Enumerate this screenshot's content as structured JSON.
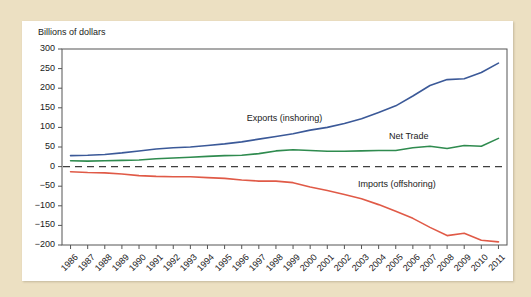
{
  "figure": {
    "background_color": "#ece0c2",
    "panel_color": "#ffffff"
  },
  "chart_data": {
    "type": "line",
    "title": "",
    "subtitle": "",
    "ylabel": "Billions of dollars",
    "xlabel": "",
    "ylim": [
      -200,
      300
    ],
    "yticks": [
      300,
      250,
      200,
      150,
      100,
      50,
      0,
      -50,
      -100,
      -150,
      -200
    ],
    "ytick_labels": [
      "300",
      "250",
      "200",
      "150",
      "100",
      "50",
      "0",
      "−50",
      "−100",
      "−150",
      "−200"
    ],
    "grid": false,
    "legend_position": "inline-annotations",
    "zero_line": {
      "value": 0,
      "style": "dashed",
      "color": "#3f3f3f"
    },
    "categories": [
      "1986",
      "1987",
      "1988",
      "1989",
      "1990",
      "1991",
      "1992",
      "1993",
      "1994",
      "1995",
      "1996",
      "1997",
      "1998",
      "1999",
      "2000",
      "2001",
      "2002",
      "2003",
      "2004",
      "2005",
      "2006",
      "2007",
      "2008",
      "2009",
      "2010",
      "2011"
    ],
    "series": [
      {
        "name": "Exports (inshoring)",
        "color": "#3b5998",
        "label_x_frac": 0.415,
        "label_y_value": 122,
        "values": [
          28,
          29,
          31,
          35,
          40,
          45,
          48,
          50,
          54,
          58,
          63,
          70,
          77,
          84,
          93,
          100,
          110,
          122,
          138,
          155,
          180,
          207,
          222,
          224,
          240,
          264
        ]
      },
      {
        "name": "Net Trade",
        "color": "#2f8b4f",
        "label_x_frac": 0.735,
        "label_y_value": 76,
        "values": [
          15,
          14,
          15,
          16,
          17,
          20,
          22,
          24,
          26,
          28,
          29,
          33,
          40,
          43,
          41,
          39,
          39,
          40,
          41,
          41,
          48,
          52,
          46,
          54,
          52,
          72
        ]
      },
      {
        "name": "Imports (offshoring)",
        "color": "#e05a47",
        "label_x_frac": 0.665,
        "label_y_value": -47,
        "values": [
          -13,
          -15,
          -16,
          -19,
          -23,
          -25,
          -26,
          -26,
          -28,
          -30,
          -34,
          -37,
          -37,
          -41,
          -52,
          -61,
          -71,
          -82,
          -97,
          -114,
          -132,
          -155,
          -176,
          -170,
          -188,
          -192
        ]
      }
    ]
  }
}
